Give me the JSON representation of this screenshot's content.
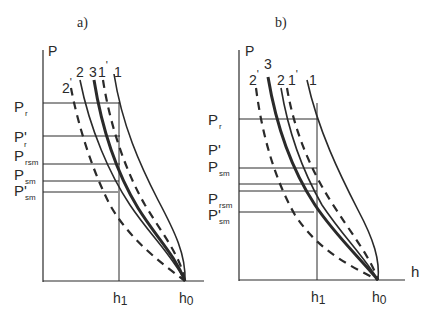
{
  "panels": [
    {
      "title": "a)",
      "y_axis_label": "P",
      "x_ticks": {
        "h1": "h",
        "h1_sub": "1",
        "h0": "h",
        "h0_sub": "0"
      },
      "levels": [
        {
          "main": "P",
          "prime": "",
          "sub": "r"
        },
        {
          "main": "P",
          "prime": "'",
          "sub": "r"
        },
        {
          "main": "P",
          "prime": "",
          "sub": "rsm"
        },
        {
          "main": "P",
          "prime": "",
          "sub": "sm"
        },
        {
          "main": "P",
          "prime": "'",
          "sub": "sm"
        }
      ],
      "curve_labels": [
        {
          "text": "2",
          "prime": "'"
        },
        {
          "text": "2",
          "prime": ""
        },
        {
          "text": "3",
          "prime": ""
        },
        {
          "text": "1",
          "prime": "'"
        },
        {
          "text": "1",
          "prime": ""
        }
      ]
    },
    {
      "title": "b)",
      "y_axis_label": "P",
      "x_axis_label": "h",
      "x_ticks": {
        "h1": "h",
        "h1_sub": "1",
        "h0": "h",
        "h0_sub": "0"
      },
      "levels": [
        {
          "main": "P",
          "prime": "",
          "sub": "r"
        },
        {
          "main": "P",
          "prime": "'",
          "sub": ""
        },
        {
          "main": "P",
          "prime": "",
          "sub": "sm"
        },
        {
          "main": "P",
          "prime": "",
          "sub": "rsm"
        },
        {
          "main": "P",
          "prime": "'",
          "sub": "sm"
        }
      ],
      "curve_labels": [
        {
          "text": "2",
          "prime": "'"
        },
        {
          "text": "3",
          "prime": ""
        },
        {
          "text": "2",
          "prime": ""
        },
        {
          "text": "1",
          "prime": "'"
        },
        {
          "text": "1",
          "prime": ""
        }
      ]
    }
  ],
  "legend": {
    "solid_thin": "curves 1, 2",
    "solid_thick": "curve 3",
    "dashed": "curves 1', 2'"
  },
  "colors": {
    "line": "#2a2a2a",
    "background": "#ffffff"
  }
}
